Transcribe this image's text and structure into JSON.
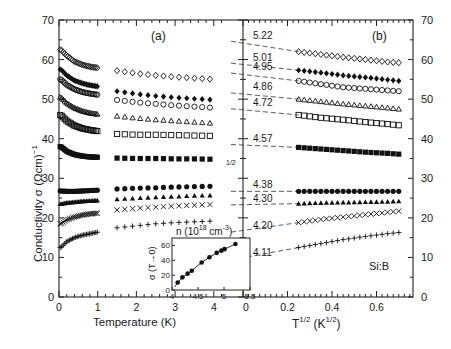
{
  "chart_data": [
    {
      "panel": "(a)",
      "type": "scatter",
      "title": "(a)",
      "xlabel": "Temperature (K)",
      "ylabel": "Conductivity σ (Ωcm)⁻¹",
      "xlim": [
        0,
        4.3
      ],
      "ylim": [
        0,
        70
      ],
      "xticks": [
        "0",
        "1",
        "2",
        "3",
        "4"
      ],
      "yticks": [
        "0",
        "10",
        "20",
        "30",
        "40",
        "50",
        "60",
        "70"
      ],
      "series": [
        {
          "name": "n=5.22",
          "marker": "open-diamond",
          "x": [
            0.05,
            0.2,
            0.4,
            0.6,
            0.8,
            1.0,
            1.5,
            2.0,
            2.5,
            3.0,
            3.5,
            4.0
          ],
          "y": [
            62.5,
            61,
            59.5,
            58.7,
            58.2,
            57.9,
            57.2,
            56.5,
            56,
            55.6,
            55.3,
            55
          ]
        },
        {
          "name": "n=5.01",
          "marker": "filled-diamond",
          "x": [
            0.05,
            0.2,
            0.4,
            0.6,
            0.8,
            1.0,
            1.5,
            2.0,
            2.5,
            3.0,
            3.5,
            4.0
          ],
          "y": [
            57.5,
            56,
            54.7,
            54,
            53.5,
            53.2,
            52,
            51.3,
            50.8,
            50.4,
            50.1,
            49.8
          ]
        },
        {
          "name": "n=4.95",
          "marker": "open-circle",
          "x": [
            0.05,
            0.2,
            0.4,
            0.6,
            0.8,
            1.0,
            1.5,
            2.0,
            2.5,
            3.0,
            3.5,
            4.0
          ],
          "y": [
            55,
            53.6,
            52.5,
            51.8,
            51.4,
            51.1,
            49.8,
            49.2,
            48.8,
            48.4,
            48.1,
            47.8
          ]
        },
        {
          "name": "n=4.86",
          "marker": "open-triangle",
          "x": [
            0.05,
            0.2,
            0.4,
            0.6,
            0.8,
            1.0,
            1.5,
            2.0,
            2.5,
            3.0,
            3.5,
            4.0
          ],
          "y": [
            50.5,
            49,
            47.8,
            47,
            46.5,
            46.2,
            45.7,
            45.2,
            44.8,
            44.5,
            44.2,
            43.9
          ]
        },
        {
          "name": "n=4.72",
          "marker": "open-square",
          "x": [
            0.05,
            0.2,
            0.4,
            0.6,
            0.8,
            1.0,
            1.5,
            2.0,
            2.5,
            3.0,
            3.5,
            4.0
          ],
          "y": [
            46,
            44.5,
            43.3,
            42.6,
            42.2,
            41.9,
            41.2,
            41,
            41,
            40.9,
            40.8,
            40.7
          ]
        },
        {
          "name": "n=4.57",
          "marker": "filled-square",
          "x": [
            0.05,
            0.2,
            0.4,
            0.6,
            0.8,
            1.0,
            1.5,
            2.0,
            2.5,
            3.0,
            3.5,
            4.0
          ],
          "y": [
            38,
            36.8,
            36,
            35.6,
            35.4,
            35.3,
            35.1,
            35,
            35,
            34.9,
            34.9,
            34.8
          ]
        },
        {
          "name": "n=4.38",
          "marker": "filled-circle",
          "x": [
            0.05,
            0.2,
            0.4,
            0.6,
            0.8,
            1.0,
            1.5,
            2.0,
            2.5,
            3.0,
            3.5,
            4.0
          ],
          "y": [
            26.8,
            26.7,
            26.7,
            26.8,
            26.9,
            27,
            27.3,
            27.5,
            27.6,
            27.8,
            27.9,
            28
          ]
        },
        {
          "name": "n=4.30",
          "marker": "filled-triangle",
          "x": [
            0.05,
            0.2,
            0.4,
            0.6,
            0.8,
            1.0,
            1.5,
            2.0,
            2.5,
            3.0,
            3.5,
            4.0
          ],
          "y": [
            23.5,
            23.8,
            24,
            24.2,
            24.3,
            24.4,
            24.7,
            25,
            25.2,
            25.4,
            25.6,
            25.7
          ]
        },
        {
          "name": "n=4.20",
          "marker": "cross-x",
          "x": [
            0.05,
            0.2,
            0.4,
            0.6,
            0.8,
            1.0,
            1.5,
            2.0,
            2.5,
            3.0,
            3.5,
            4.0
          ],
          "y": [
            18.5,
            19.5,
            20.2,
            20.7,
            21,
            21.2,
            22,
            22.4,
            22.7,
            23,
            23.2,
            23.4
          ]
        },
        {
          "name": "n=4.11",
          "marker": "plus",
          "x": [
            0.05,
            0.2,
            0.4,
            0.6,
            0.8,
            1.0,
            1.5,
            2.0,
            2.5,
            3.0,
            3.5,
            4.0
          ],
          "y": [
            12.5,
            14,
            15,
            15.6,
            16,
            16.4,
            17.5,
            18,
            18.5,
            18.8,
            19,
            19.2
          ]
        }
      ],
      "inset": {
        "type": "scatter",
        "title": "n (10^18 cm^-3)",
        "xlabel": "n (10^18 cm^-3)",
        "ylabel": "σ (T→0)",
        "xlim": [
          4,
          5.5
        ],
        "ylim": [
          0,
          70
        ],
        "xticks": [
          "4",
          "4.5",
          "5",
          "5.5"
        ],
        "yticks": [
          "0",
          "20",
          "40",
          "60"
        ],
        "x": [
          4.11,
          4.2,
          4.3,
          4.38,
          4.57,
          4.72,
          4.86,
          4.95,
          5.01,
          5.22
        ],
        "y": [
          10,
          17,
          22,
          26,
          37,
          44,
          50,
          53,
          55,
          62
        ],
        "fit_line": true
      }
    },
    {
      "panel": "(b)",
      "type": "scatter",
      "title": "(b)",
      "xlabel": "T^1/2 (K^1/2)",
      "ylabel": "",
      "xlim": [
        0,
        0.75
      ],
      "ylim": [
        0,
        70
      ],
      "xticks": [
        "0.2",
        "0.4",
        "0.6"
      ],
      "yticks_right": [
        "0",
        "10",
        "20",
        "30",
        "40",
        "50",
        "60",
        "70"
      ],
      "annotation": "Si:B",
      "curve_labels": [
        "5.22",
        "5.01",
        "4.95",
        "4.86",
        "4.72",
        "4.57",
        "4.38",
        "4.30",
        "4.20",
        "4.11"
      ],
      "series": [
        {
          "name": "5.22",
          "marker": "open-diamond",
          "x": [
            0.25,
            0.35,
            0.45,
            0.55,
            0.65,
            0.7
          ],
          "y": [
            62,
            61.3,
            60.6,
            60,
            59.4,
            59.2
          ],
          "extrapolation_t0": 64.5
        },
        {
          "name": "5.01",
          "marker": "filled-diamond",
          "x": [
            0.25,
            0.35,
            0.45,
            0.55,
            0.65,
            0.7
          ],
          "y": [
            57.3,
            56.7,
            56,
            55.5,
            54.9,
            54.6
          ],
          "extrapolation_t0": 59
        },
        {
          "name": "4.95",
          "marker": "open-circle",
          "x": [
            0.25,
            0.35,
            0.45,
            0.55,
            0.65,
            0.7
          ],
          "y": [
            54.6,
            53.8,
            53,
            52.6,
            52.2,
            52
          ],
          "extrapolation_t0": 56.5
        },
        {
          "name": "4.86",
          "marker": "open-triangle",
          "x": [
            0.25,
            0.35,
            0.45,
            0.55,
            0.65,
            0.7
          ],
          "y": [
            50,
            49.4,
            48.8,
            48.3,
            47.8,
            47.5
          ],
          "extrapolation_t0": 51.5
        },
        {
          "name": "4.72",
          "marker": "open-square",
          "x": [
            0.25,
            0.35,
            0.45,
            0.55,
            0.65,
            0.7
          ],
          "y": [
            46,
            45.3,
            44.8,
            44.2,
            43.7,
            43.4
          ],
          "extrapolation_t0": 47.5
        },
        {
          "name": "4.57",
          "marker": "filled-square",
          "x": [
            0.25,
            0.35,
            0.45,
            0.55,
            0.65,
            0.7
          ],
          "y": [
            37.8,
            37.4,
            37,
            36.6,
            36.3,
            36.1
          ],
          "extrapolation_t0": 38.5
        },
        {
          "name": "4.38",
          "marker": "filled-circle",
          "x": [
            0.25,
            0.35,
            0.45,
            0.55,
            0.65,
            0.7
          ],
          "y": [
            26.7,
            26.7,
            26.7,
            26.7,
            26.7,
            26.7
          ],
          "extrapolation_t0": 26.7
        },
        {
          "name": "4.30",
          "marker": "filled-triangle",
          "x": [
            0.25,
            0.35,
            0.45,
            0.55,
            0.65,
            0.7
          ],
          "y": [
            23.6,
            23.8,
            23.9,
            24,
            24.1,
            24.2
          ],
          "extrapolation_t0": 23.3
        },
        {
          "name": "4.20",
          "marker": "cross-x",
          "x": [
            0.25,
            0.35,
            0.45,
            0.55,
            0.65,
            0.7
          ],
          "y": [
            18.8,
            19.6,
            20.2,
            20.8,
            21.4,
            21.7
          ],
          "extrapolation_t0": 16.5
        },
        {
          "name": "4.11",
          "marker": "plus",
          "x": [
            0.25,
            0.35,
            0.45,
            0.55,
            0.65,
            0.7
          ],
          "y": [
            12.5,
            13.5,
            14.5,
            15.3,
            16,
            16.3
          ],
          "extrapolation_t0": 9.5
        }
      ]
    }
  ],
  "labels": {
    "panel_a": "(a)",
    "panel_b": "(b)",
    "ylabel": "Conductivity σ (Ωcm)",
    "ylabel_sup": "−1",
    "xlabel_a": "Temperature (K)",
    "xlabel_b_main": "T",
    "xlabel_b_sup": "1/2",
    "xlabel_b_unit": "(K",
    "xlabel_b_unit_sup": "1/2",
    "xlabel_b_close": ")",
    "half_mark": "1/2",
    "material": "Si:B",
    "inset_title_main": "n (10",
    "inset_title_sup1": "18",
    "inset_title_unit": " cm",
    "inset_title_sup2": "-3",
    "inset_title_close": ")",
    "inset_ylabel": "σ (T→0)"
  }
}
